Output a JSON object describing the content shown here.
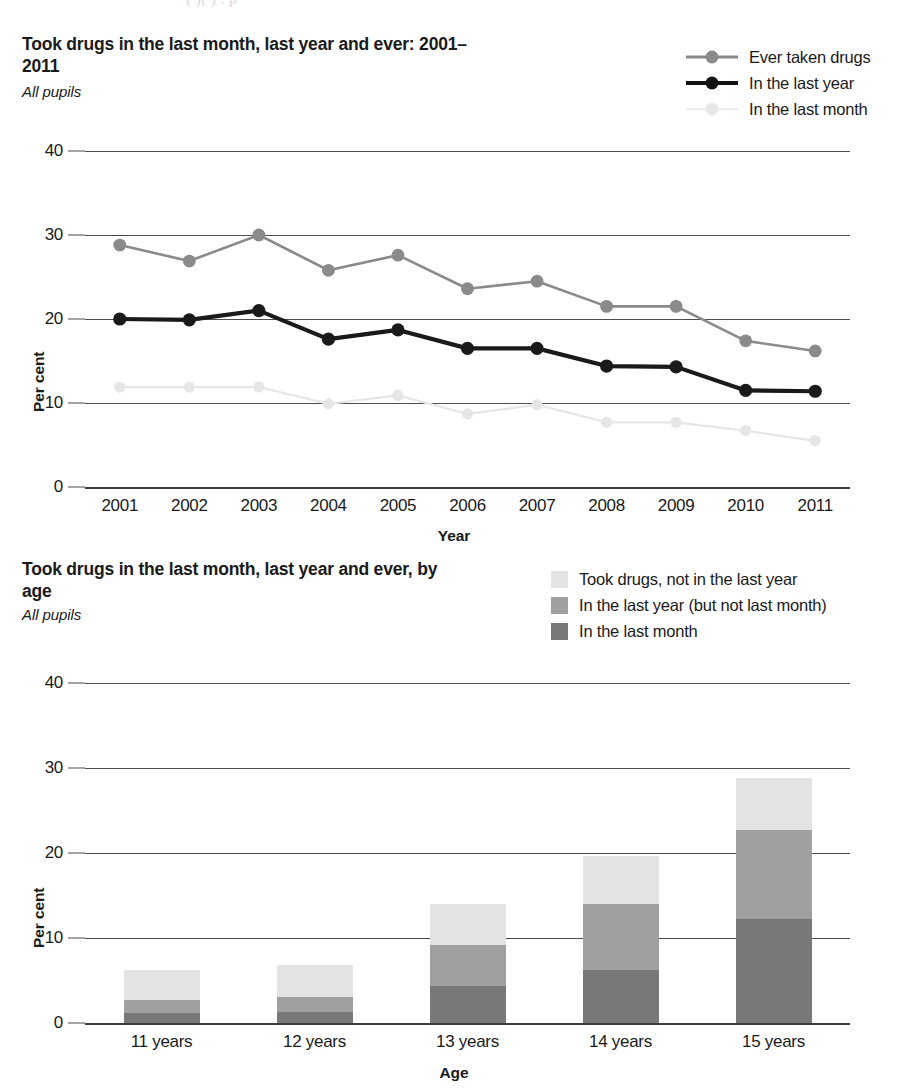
{
  "top_fragment": "(               )(          )  .    p",
  "chart1": {
    "title": "Took drugs in the last month, last year and ever: 2001–2011",
    "subtitle": "All pupils",
    "legend": [
      {
        "label": "Ever taken drugs",
        "color": "#8a8a8a",
        "marker": "circle"
      },
      {
        "label": "In the last year",
        "color": "#1a1a1a",
        "marker": "circle"
      },
      {
        "label": "In the last month",
        "color": "#e6e6e6",
        "marker": "circle"
      }
    ],
    "chart_data": {
      "type": "line",
      "title": "Took drugs in the last month, last year and ever: 2001–2011",
      "subtitle": "All pupils",
      "xlabel": "Year",
      "ylabel": "Per cent",
      "ylim": [
        0,
        40
      ],
      "yticks": [
        0,
        10,
        20,
        30,
        40
      ],
      "grid": true,
      "legend_position": "top-right",
      "x": [
        "2001",
        "2002",
        "2003",
        "2004",
        "2005",
        "2006",
        "2007",
        "2008",
        "2009",
        "2010",
        "2011"
      ],
      "series": [
        {
          "name": "Ever taken drugs",
          "color": "#8a8a8a",
          "values": [
            28.8,
            26.9,
            30.0,
            25.8,
            27.6,
            23.6,
            24.5,
            21.5,
            21.5,
            17.4,
            16.2
          ]
        },
        {
          "name": "In the last year",
          "color": "#1a1a1a",
          "values": [
            20.0,
            19.9,
            21.0,
            17.6,
            18.7,
            16.5,
            16.5,
            14.4,
            14.3,
            11.5,
            11.4
          ]
        },
        {
          "name": "In the last month",
          "color": "#e6e6e6",
          "values": [
            11.9,
            11.9,
            11.9,
            9.9,
            10.9,
            8.7,
            9.8,
            7.7,
            7.7,
            6.7,
            5.5
          ]
        }
      ]
    }
  },
  "chart2": {
    "title": "Took drugs in the last month, last year and ever, by age",
    "subtitle": "All pupils",
    "legend": [
      {
        "label": "Took drugs, not in the last year",
        "color": "#e3e3e3"
      },
      {
        "label": "In the last year (but not last month)",
        "color": "#a0a0a0"
      },
      {
        "label": "In the last month",
        "color": "#787878"
      }
    ],
    "chart_data": {
      "type": "bar",
      "stacked": true,
      "title": "Took drugs in the last month, last year and ever, by age",
      "subtitle": "All pupils",
      "xlabel": "Age",
      "ylabel": "Per cent",
      "ylim": [
        0,
        40
      ],
      "yticks": [
        0,
        10,
        20,
        30,
        40
      ],
      "grid": true,
      "legend_position": "top-right",
      "categories": [
        "11 years",
        "12 years",
        "13 years",
        "14 years",
        "15 years"
      ],
      "series": [
        {
          "name": "In the last month",
          "color": "#787878",
          "values": [
            1.2,
            1.3,
            4.4,
            6.2,
            12.2
          ]
        },
        {
          "name": "In the last year (but not last month)",
          "color": "#a0a0a0",
          "values": [
            1.5,
            1.8,
            4.8,
            7.8,
            10.5
          ]
        },
        {
          "name": "Took drugs, not in the last year",
          "color": "#e3e3e3",
          "values": [
            3.5,
            3.7,
            4.8,
            5.7,
            6.1
          ]
        }
      ],
      "totals": [
        6.2,
        6.8,
        14.0,
        19.7,
        28.8
      ]
    }
  }
}
